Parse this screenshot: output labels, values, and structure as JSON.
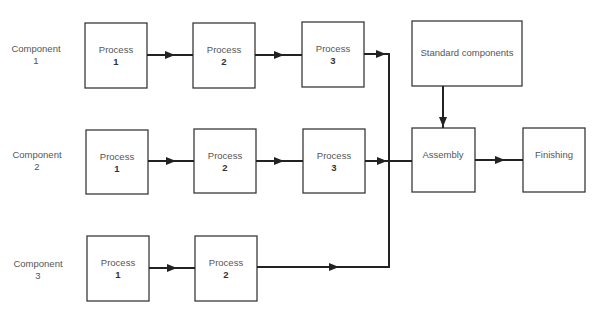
{
  "components": [
    {
      "label": "Component",
      "number": "1",
      "processes": [
        {
          "label": "Process",
          "number": "1"
        },
        {
          "label": "Process",
          "number": "2"
        },
        {
          "label": "Process",
          "number": "3"
        }
      ]
    },
    {
      "label": "Component",
      "number": "2",
      "processes": [
        {
          "label": "Process",
          "number": "1"
        },
        {
          "label": "Process",
          "number": "2"
        },
        {
          "label": "Process",
          "number": "3"
        }
      ]
    },
    {
      "label": "Component",
      "number": "3",
      "processes": [
        {
          "label": "Process",
          "number": "1"
        },
        {
          "label": "Process",
          "number": "2"
        }
      ]
    }
  ],
  "standard_components": {
    "label": "Standard components"
  },
  "assembly": {
    "label": "Assembly"
  },
  "finishing": {
    "label": "Finishing"
  },
  "colors": {
    "stroke": "#222222",
    "text": "#555555",
    "background": "#ffffff"
  }
}
